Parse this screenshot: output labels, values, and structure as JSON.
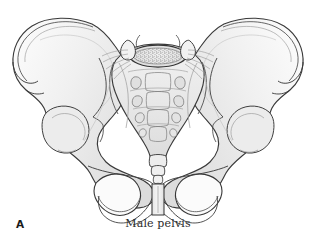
{
  "figure": {
    "panel_label": "A",
    "caption": "Male pelvis",
    "view": "anterior",
    "style": "line-drawing-with-grey-shading",
    "background_color": "#ffffff",
    "outline_color": "#3a3a3a",
    "bone_fill_light": "#fbfbfb",
    "bone_fill_mid": "#ececec",
    "bone_fill_shadow": "#d8d8d8",
    "detail_line_color": "#8a8a8a",
    "stipple_color": "#4a4a4a",
    "caption_color": "#2b2b2b",
    "label_color": "#1a1a1a"
  },
  "anatomy": {
    "structures": [
      {
        "id": "ilium-left",
        "label": "Left ilium",
        "side": "left"
      },
      {
        "id": "ilium-right",
        "label": "Right ilium",
        "side": "right"
      },
      {
        "id": "iliac-crest-left",
        "label": "Left iliac crest",
        "side": "left"
      },
      {
        "id": "iliac-crest-right",
        "label": "Right iliac crest",
        "side": "right"
      },
      {
        "id": "anterior-superior-iliac-spine-left",
        "label": "Left anterior superior iliac spine",
        "side": "left"
      },
      {
        "id": "anterior-superior-iliac-spine-right",
        "label": "Right anterior superior iliac spine",
        "side": "right"
      },
      {
        "id": "anterior-inferior-iliac-spine-left",
        "label": "Left anterior inferior iliac spine",
        "side": "left"
      },
      {
        "id": "anterior-inferior-iliac-spine-right",
        "label": "Right anterior inferior iliac spine",
        "side": "right"
      },
      {
        "id": "greater-sciatic-notch-left",
        "label": "Left greater sciatic notch",
        "side": "left"
      },
      {
        "id": "greater-sciatic-notch-right",
        "label": "Right greater sciatic notch",
        "side": "right"
      },
      {
        "id": "acetabulum-left",
        "label": "Left acetabulum",
        "side": "left"
      },
      {
        "id": "acetabulum-right",
        "label": "Right acetabulum",
        "side": "right"
      },
      {
        "id": "obturator-foramen-left",
        "label": "Left obturator foramen",
        "side": "left"
      },
      {
        "id": "obturator-foramen-right",
        "label": "Right obturator foramen",
        "side": "right"
      },
      {
        "id": "ischial-tuberosity-left",
        "label": "Left ischial tuberosity",
        "side": "left"
      },
      {
        "id": "ischial-tuberosity-right",
        "label": "Right ischial tuberosity",
        "side": "right"
      },
      {
        "id": "superior-pubic-ramus-left",
        "label": "Left superior pubic ramus",
        "side": "left"
      },
      {
        "id": "superior-pubic-ramus-right",
        "label": "Right superior pubic ramus",
        "side": "right"
      },
      {
        "id": "pubic-symphysis",
        "label": "Pubic symphysis",
        "side": "midline"
      },
      {
        "id": "subpubic-arch",
        "label": "Subpubic arch",
        "side": "midline"
      },
      {
        "id": "sacrum",
        "label": "Sacrum",
        "side": "midline"
      },
      {
        "id": "sacral-promontory",
        "label": "Sacral promontory",
        "side": "midline"
      },
      {
        "id": "coccyx",
        "label": "Coccyx",
        "side": "midline"
      },
      {
        "id": "l5-vertebral-body",
        "label": "Fifth lumbar vertebral body",
        "side": "midline"
      },
      {
        "id": "sacroiliac-joint-left",
        "label": "Left sacroiliac joint",
        "side": "left"
      },
      {
        "id": "sacroiliac-joint-right",
        "label": "Right sacroiliac joint",
        "side": "right"
      }
    ],
    "sacral_foramina_pairs": 4,
    "coccyx_segments": 4,
    "l5_body_texture": "stippled"
  }
}
